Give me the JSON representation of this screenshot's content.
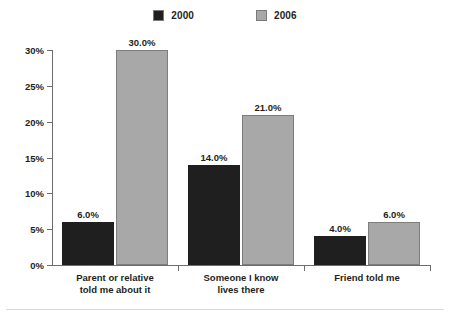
{
  "chart_data": {
    "type": "bar",
    "title": "",
    "subtitle": "",
    "xlabel": "",
    "ylabel": "",
    "ylim": [
      0,
      30
    ],
    "ytick_values": [
      0,
      5,
      10,
      15,
      20,
      25,
      30
    ],
    "ytick_labels": [
      "0%",
      "5%",
      "10%",
      "15%",
      "20%",
      "25%",
      "30%"
    ],
    "grid": false,
    "legend_position": "top-center",
    "categories": [
      {
        "line1": "Parent or relative",
        "line2": "told me about it"
      },
      {
        "line1": "Someone I know",
        "line2": "lives there"
      },
      {
        "line1": "Friend told me",
        "line2": ""
      }
    ],
    "series": [
      {
        "name": "2000",
        "color": "#1f1f1f",
        "values": [
          6.0,
          14.0,
          4.0
        ],
        "labels": [
          "6.0%",
          "14.0%",
          "4.0%"
        ]
      },
      {
        "name": "2006",
        "color": "#a8a8a8",
        "values": [
          30.0,
          21.0,
          6.0
        ],
        "labels": [
          "30.0%",
          "21.0%",
          "6.0%"
        ]
      }
    ]
  }
}
